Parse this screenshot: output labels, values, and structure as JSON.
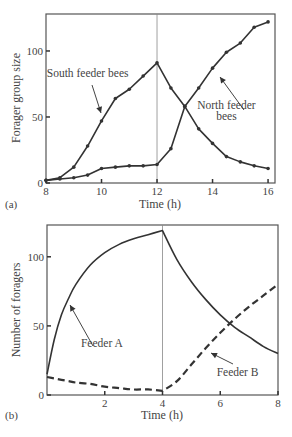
{
  "chart_data": [
    {
      "panel_label": "(a)",
      "type": "line",
      "title": "",
      "xlabel": "Time (h)",
      "ylabel": "Forager group size",
      "xlim": [
        8,
        16.25
      ],
      "ylim": [
        0,
        128
      ],
      "xticks": [
        8,
        10,
        12,
        14,
        16
      ],
      "yticks": [
        0,
        50,
        100
      ],
      "grid": false,
      "vline_x": 12,
      "markers": true,
      "x": [
        8,
        8.5,
        9,
        9.5,
        10,
        10.5,
        11,
        11.5,
        12,
        12.5,
        13,
        13.5,
        14,
        14.5,
        15,
        15.5,
        16
      ],
      "series": [
        {
          "name": "South feeder bees",
          "style": "solid",
          "values": [
            2,
            4,
            12,
            28,
            47,
            64,
            71,
            81,
            91,
            72,
            58,
            41,
            30,
            20,
            16,
            13,
            11
          ]
        },
        {
          "name": "North feeder bees",
          "style": "solid",
          "values": [
            2,
            3,
            4,
            6,
            11,
            12,
            13,
            13,
            14,
            26,
            58,
            72,
            87,
            99,
            106,
            118,
            122
          ]
        }
      ],
      "annotations": [
        {
          "text": "South feeder bees",
          "x": 9.5,
          "y": 80
        },
        {
          "text": "North feeder",
          "x": 14.5,
          "y": 56
        },
        {
          "text": "bees",
          "x": 14.5,
          "y": 48
        }
      ]
    },
    {
      "panel_label": "(b)",
      "type": "line",
      "title": "",
      "xlabel": "Time (h)",
      "ylabel": "Number of foragers",
      "xlim": [
        0,
        8
      ],
      "ylim": [
        0,
        123
      ],
      "xticks": [
        2,
        4,
        6,
        8
      ],
      "yticks": [
        0,
        50,
        100
      ],
      "grid": false,
      "vline_x": 4,
      "markers": false,
      "x": [
        0,
        0.25,
        0.5,
        0.75,
        1,
        1.5,
        2,
        2.5,
        3,
        3.5,
        4,
        4.5,
        5,
        5.5,
        6,
        6.5,
        7,
        7.5,
        8
      ],
      "series": [
        {
          "name": "Feeder A",
          "style": "solid",
          "values": [
            15,
            40,
            58,
            70,
            80,
            94,
            103,
            109,
            113,
            116,
            119,
            98,
            82,
            69,
            58,
            49,
            42,
            35,
            30
          ]
        },
        {
          "name": "Feeder B",
          "style": "dashed",
          "values": [
            13,
            12,
            11,
            10,
            9,
            8,
            6,
            5,
            4,
            4,
            3,
            10,
            22,
            34,
            45,
            55,
            64,
            72,
            80
          ]
        }
      ],
      "annotations": [
        {
          "text": "Feeder A",
          "x": 1.9,
          "y": 35
        },
        {
          "text": "Feeder B",
          "x": 6.6,
          "y": 14
        }
      ]
    }
  ]
}
